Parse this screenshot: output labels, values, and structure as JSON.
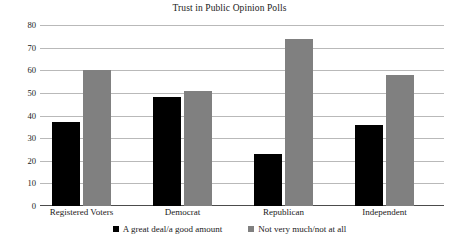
{
  "chart_data": {
    "type": "bar",
    "title": "Trust in Public Opinion Polls",
    "xlabel": "",
    "ylabel": "",
    "ylim": [
      0,
      80
    ],
    "yticks": [
      0,
      10,
      20,
      30,
      40,
      50,
      60,
      70,
      80
    ],
    "ytick_labels": [
      "0",
      "10",
      "20",
      "30",
      "40",
      "50",
      "60",
      "70",
      "80"
    ],
    "grid": true,
    "legend_position": "bottom",
    "categories": [
      "Registered Voters",
      "Democrat",
      "Republican",
      "Independent"
    ],
    "series": [
      {
        "name": "A great deal/a good amount",
        "color": "#000000",
        "values": [
          37,
          48,
          23,
          36
        ]
      },
      {
        "name": "Not very much/not at all",
        "color": "#808080",
        "values": [
          60,
          51,
          74,
          58
        ]
      }
    ]
  },
  "colors": {
    "series0": "#000000",
    "series1": "#808080",
    "gridline": "#b9b9b9",
    "axis": "#4c4c4c",
    "text": "#1a1a1a",
    "background": "#ffffff"
  }
}
